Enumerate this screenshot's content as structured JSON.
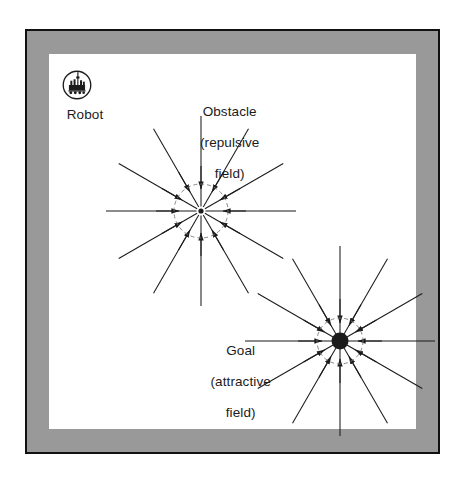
{
  "figure": {
    "background": "#ffffff",
    "mat_color": "#999999",
    "border_color": "#111111",
    "canvas_color": "#ffffff",
    "ink_color": "#1b1b1b"
  },
  "robot": {
    "icon": "robot-circle-icon",
    "label": "Robot"
  },
  "obstacle": {
    "label": "Obstacle\n(repulsive\nfield)",
    "label_line1": "Obstacle",
    "label_line2": "(repulsive",
    "label_line3": "field)",
    "marker": "dot-with-dashed-circle"
  },
  "goal": {
    "label": "Goal\n(attractive\nfield)",
    "label_line1": "Goal",
    "label_line2": "(attractive",
    "label_line3": "field)",
    "marker": "filled-disc-with-dashed-circle"
  },
  "chart_data": {
    "type": "scatter",
    "title": "",
    "xlabel": "",
    "ylabel": "",
    "annotations": [
      "Obstacle (repulsive field)",
      "Goal (attractive field)",
      "Robot"
    ],
    "series": [
      {
        "name": "obstacle-repulsive-field",
        "center": [
          201,
          211
        ],
        "ray_count": 12,
        "ray_length": 95,
        "inner_radius": 18,
        "arrow_radius": 45,
        "arrow_direction": "inward",
        "angles_deg": [
          0,
          30,
          60,
          90,
          120,
          150,
          180,
          210,
          240,
          270,
          300,
          330
        ]
      },
      {
        "name": "goal-attractive-field",
        "center": [
          340,
          341
        ],
        "ray_count": 12,
        "ray_length": 95,
        "inner_radius": 14,
        "arrow_radius": 42,
        "arrow_direction": "inward",
        "angles_deg": [
          0,
          30,
          60,
          90,
          120,
          150,
          180,
          210,
          240,
          270,
          300,
          330
        ]
      }
    ],
    "grid": false,
    "legend": "none"
  }
}
